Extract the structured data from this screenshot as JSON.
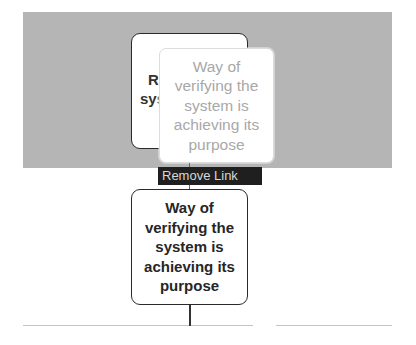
{
  "diagram": {
    "back_node": {
      "partial_lines": [
        "R",
        "sys"
      ],
      "border_color": "#2a2a2a"
    },
    "ghost_node": {
      "lines": [
        "Way of",
        "verifying the",
        "system is",
        "achieving its",
        "purpose"
      ],
      "text_color": "#a8a8a8"
    },
    "main_node": {
      "lines": [
        "Way of",
        "verifying the",
        "system is",
        "achieving its",
        "purpose"
      ],
      "text_color": "#262626"
    },
    "context_action": {
      "label": "Remove Link",
      "background": "#1f1f1f",
      "text_color": "#d8d8d8"
    },
    "drag_region": {
      "color": "#b5b5b5"
    }
  }
}
